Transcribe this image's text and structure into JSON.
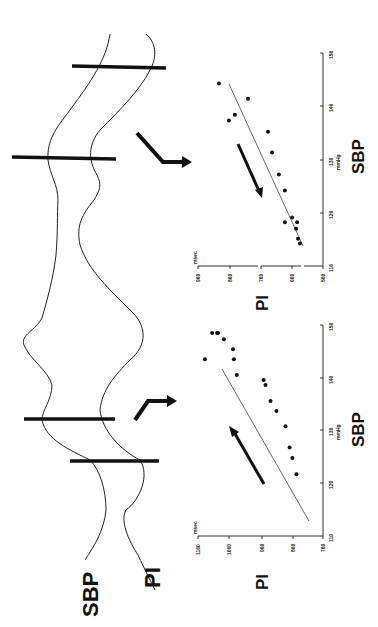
{
  "figure": {
    "orientation": "rotated 90 degrees counter-clockwise",
    "trace_labels": {
      "sbp": "SBP",
      "pi": "PI"
    }
  },
  "chart_data": [
    {
      "type": "scatter",
      "title": "PI vs SBP (rising SBP)",
      "xlabel": "SBP",
      "xunit": "mmHg",
      "ylabel": "PI",
      "yunit": "msec",
      "xticks": [
        110,
        120,
        130,
        140,
        150
      ],
      "yticks": [
        760,
        860,
        960,
        1060,
        1160
      ],
      "xlim": [
        110,
        150
      ],
      "ylim": [
        760,
        1160
      ],
      "arrow_direction": "up-right (increasing SBP and PI)",
      "regression_line": {
        "from": [
          119,
          800
        ],
        "to": [
          147,
          1080
        ]
      },
      "points": [
        {
          "sbp": 148.5,
          "pi": 1115
        },
        {
          "sbp": 148.5,
          "pi": 1099
        },
        {
          "sbp": 148.5,
          "pi": 1096
        },
        {
          "sbp": 147.3,
          "pi": 1077
        },
        {
          "sbp": 145.4,
          "pi": 1048
        },
        {
          "sbp": 143.5,
          "pi": 1045
        },
        {
          "sbp": 140.5,
          "pi": 1036
        },
        {
          "sbp": 143.5,
          "pi": 1138
        },
        {
          "sbp": 139.6,
          "pi": 950
        },
        {
          "sbp": 138.6,
          "pi": 944
        },
        {
          "sbp": 135.6,
          "pi": 928
        },
        {
          "sbp": 133.7,
          "pi": 909
        },
        {
          "sbp": 130.8,
          "pi": 880
        },
        {
          "sbp": 126.8,
          "pi": 867
        },
        {
          "sbp": 124.8,
          "pi": 858
        },
        {
          "sbp": 121.7,
          "pi": 845
        }
      ]
    },
    {
      "type": "scatter",
      "title": "PI vs SBP (falling SBP)",
      "xlabel": "SBP",
      "xunit": "mmHg",
      "ylabel": "PI",
      "yunit": "msec",
      "xticks": [
        116,
        126,
        136,
        146,
        156
      ],
      "yticks": [
        560,
        660,
        760,
        860,
        960
      ],
      "xlim": [
        116,
        156
      ],
      "ylim": [
        560,
        960
      ],
      "arrow_direction": "down-left (decreasing SBP and PI)",
      "regression_line": {
        "from": [
          119,
          620
        ],
        "to": [
          153,
          906
        ]
      },
      "points": [
        {
          "sbp": 150.3,
          "pi": 893
        },
        {
          "sbp": 143.3,
          "pi": 861
        },
        {
          "sbp": 144.4,
          "pi": 842
        },
        {
          "sbp": 147.4,
          "pi": 800
        },
        {
          "sbp": 141.2,
          "pi": 736
        },
        {
          "sbp": 137.3,
          "pi": 723
        },
        {
          "sbp": 133.2,
          "pi": 701
        },
        {
          "sbp": 130.2,
          "pi": 682
        },
        {
          "sbp": 124.2,
          "pi": 682
        },
        {
          "sbp": 125.1,
          "pi": 659
        },
        {
          "sbp": 124.2,
          "pi": 643
        },
        {
          "sbp": 123.0,
          "pi": 646
        },
        {
          "sbp": 121.1,
          "pi": 640
        },
        {
          "sbp": 120.2,
          "pi": 634
        }
      ]
    }
  ],
  "charts": {
    "left": {
      "pi_label": "PI",
      "sbp_label": "SBP",
      "pi_unit": "msec",
      "sbp_unit": "mmHg",
      "pi_ticks": [
        "1160",
        "1060",
        "960",
        "860",
        "760"
      ],
      "sbp_ticks": [
        "110",
        "120",
        "130",
        "140",
        "150"
      ]
    },
    "right": {
      "pi_label": "PI",
      "sbp_label": "SBP",
      "pi_unit": "msec",
      "sbp_unit": "mmHg",
      "pi_ticks": [
        "960",
        "860",
        "760",
        "660",
        "560"
      ],
      "sbp_ticks": [
        "116",
        "126",
        "136",
        "146",
        "156"
      ]
    }
  }
}
